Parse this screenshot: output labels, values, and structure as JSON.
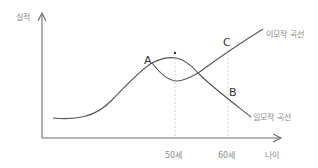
{
  "diagram": {
    "y_axis_label": "실적",
    "x_axis_label": "나이",
    "x_ticks": [
      "50세",
      "60세"
    ],
    "points": {
      "a": "A",
      "b": "B",
      "c": "C",
      "star": "*"
    },
    "curves": {
      "double_career": "이모작 곡선",
      "single_career": "일모작 곡선"
    },
    "colors": {
      "line": "#555555",
      "axis": "#6a6a6a",
      "label": "#8a8a8a",
      "guide": "#d0d0d0"
    }
  }
}
